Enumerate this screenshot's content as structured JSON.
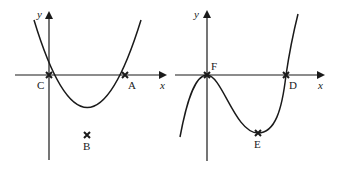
{
  "graphs": [
    {
      "id": "left",
      "type": "quadratic",
      "axis_labels": {
        "x": "x",
        "y": "y"
      },
      "points": {
        "C": "C",
        "A": "A",
        "B": "B"
      },
      "description": "Upward parabola crossing x-axis at C (origin) and A, minimum at B"
    },
    {
      "id": "right",
      "type": "cubic",
      "axis_labels": {
        "x": "x",
        "y": "y"
      },
      "points": {
        "F": "F",
        "D": "D",
        "E": "E"
      },
      "description": "Cubic with local max at F (origin), local min at E, crossing x-axis at D"
    }
  ],
  "colors": {
    "ink": "#1a1a1a",
    "background": "#ffffff"
  }
}
